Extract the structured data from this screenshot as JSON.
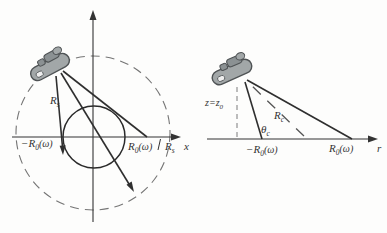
{
  "figure": {
    "colors": {
      "background": "#fdfdfc",
      "solid_line": "#2f2f2f",
      "dashed_line": "#757575",
      "aircraft_body": "#a2a7a8",
      "aircraft_top": "#8b9193",
      "aircraft_outline": "#4f5355",
      "aircraft_window": "#eeeeee",
      "text": "#333333"
    },
    "icons": {
      "aircraft": "radar-aircraft-icon"
    },
    "left_diagram": {
      "labels": {
        "slant_range": {
          "base": "R",
          "sub": "s"
        },
        "neg_r0": {
          "base": "−R",
          "sub": "0",
          "suffix": "(ω)"
        },
        "pos_r0": {
          "base": "R",
          "sub": "0",
          "suffix": "(ω)"
        },
        "circle_radius": {
          "base": "R",
          "sub": "s"
        },
        "x_axis": "x"
      }
    },
    "right_diagram": {
      "labels": {
        "altitude": {
          "base": "z=z",
          "sub": "0"
        },
        "center_range": {
          "base": "R",
          "sub": "c"
        },
        "look_angle": {
          "base": "θ",
          "sub": "c"
        },
        "neg_r0": {
          "base": "−R",
          "sub": "0",
          "suffix": "(ω)"
        },
        "pos_r0": {
          "base": "R",
          "sub": "0",
          "suffix": "(ω)"
        },
        "r_axis": "r"
      }
    }
  }
}
